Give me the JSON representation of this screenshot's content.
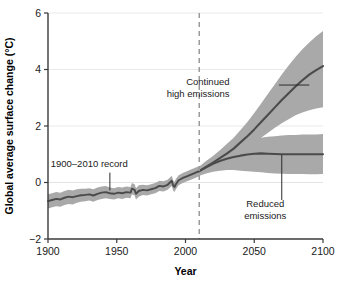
{
  "chart_data": {
    "type": "line",
    "title": "",
    "xlabel": "Year",
    "ylabel": "Global average surface change (°C)",
    "xlim": [
      1900,
      2100
    ],
    "ylim": [
      -2,
      6
    ],
    "xticks": [
      1900,
      1950,
      2000,
      2050,
      2100
    ],
    "yticks": [
      -2,
      0,
      2,
      4,
      6
    ],
    "xtick_labels": [
      "1900",
      "1950",
      "2000",
      "2050",
      "2100"
    ],
    "ytick_labels": [
      "−2",
      "0",
      "2",
      "4",
      "6"
    ],
    "grid": "horizontal",
    "legend": "none",
    "colors": {
      "line": "#4b4b4b",
      "band": "#a9a9a9",
      "grid": "#e9e9e9",
      "axis": "#3a3a3a",
      "divider": "#9a9a9a",
      "background": "#ffffff"
    },
    "divider": {
      "x": 2010,
      "style": "dashed",
      "label": ""
    },
    "annotations": [
      {
        "name": "historical-record",
        "text": "1900–2010 record",
        "text_x": 1930,
        "text_y": 0.55,
        "leader_from_x": 1945,
        "leader_from_y": 0.35,
        "leader_to_x": 1945,
        "leader_to_y": -0.28
      },
      {
        "name": "continued-high-emissions",
        "line1": "Continued",
        "line2": "high emissions",
        "text_x": 2032,
        "text_y": 3.45,
        "leader_from_x": 2068,
        "leader_from_y": 3.45,
        "leader_to_x": 2090,
        "leader_to_y": 3.45
      },
      {
        "name": "reduced-emissions",
        "line1": "Reduced",
        "line2": "emissions",
        "text_x": 2058,
        "text_y": -0.85,
        "leader_from_x": 2070,
        "leader_from_y": -0.62,
        "leader_to_x": 2070,
        "leader_to_y": 0.98
      }
    ],
    "series": [
      {
        "name": "historical",
        "label": "1900–2010 record",
        "x": [
          1900,
          1903,
          1906,
          1909,
          1912,
          1915,
          1918,
          1921,
          1924,
          1927,
          1930,
          1933,
          1936,
          1939,
          1942,
          1945,
          1948,
          1951,
          1954,
          1957,
          1960,
          1961,
          1963,
          1964,
          1966,
          1969,
          1972,
          1975,
          1978,
          1981,
          1984,
          1987,
          1990,
          1991,
          1992,
          1993,
          1995,
          1998,
          2001,
          2004,
          2007,
          2010
        ],
        "y": [
          -0.66,
          -0.62,
          -0.58,
          -0.6,
          -0.54,
          -0.5,
          -0.52,
          -0.48,
          -0.45,
          -0.44,
          -0.42,
          -0.46,
          -0.4,
          -0.36,
          -0.34,
          -0.38,
          -0.4,
          -0.36,
          -0.38,
          -0.34,
          -0.36,
          -0.22,
          -0.26,
          -0.4,
          -0.3,
          -0.26,
          -0.28,
          -0.24,
          -0.2,
          -0.12,
          -0.14,
          -0.08,
          0.06,
          -0.1,
          -0.16,
          -0.06,
          0.08,
          0.16,
          0.22,
          0.28,
          0.34,
          0.4
        ],
        "lower": [
          -0.92,
          -0.88,
          -0.84,
          -0.86,
          -0.8,
          -0.76,
          -0.78,
          -0.72,
          -0.68,
          -0.66,
          -0.64,
          -0.68,
          -0.62,
          -0.58,
          -0.56,
          -0.58,
          -0.6,
          -0.56,
          -0.58,
          -0.54,
          -0.56,
          -0.42,
          -0.46,
          -0.6,
          -0.5,
          -0.44,
          -0.46,
          -0.42,
          -0.38,
          -0.3,
          -0.32,
          -0.26,
          -0.12,
          -0.28,
          -0.34,
          -0.24,
          -0.1,
          -0.02,
          0.04,
          0.1,
          0.16,
          0.22
        ],
        "upper": [
          -0.42,
          -0.38,
          -0.34,
          -0.36,
          -0.3,
          -0.26,
          -0.28,
          -0.24,
          -0.22,
          -0.22,
          -0.2,
          -0.24,
          -0.18,
          -0.14,
          -0.12,
          -0.18,
          -0.2,
          -0.16,
          -0.18,
          -0.14,
          -0.16,
          -0.02,
          -0.06,
          -0.2,
          -0.1,
          -0.08,
          -0.1,
          -0.06,
          -0.02,
          0.06,
          0.04,
          0.1,
          0.24,
          0.08,
          0.02,
          0.12,
          0.26,
          0.34,
          0.4,
          0.46,
          0.52,
          0.58
        ]
      },
      {
        "name": "continued_high_emissions",
        "label": "Continued high emissions",
        "x": [
          2010,
          2015,
          2020,
          2025,
          2030,
          2035,
          2040,
          2045,
          2050,
          2055,
          2060,
          2065,
          2070,
          2075,
          2080,
          2085,
          2090,
          2095,
          2100
        ],
        "y": [
          0.4,
          0.55,
          0.7,
          0.86,
          1.02,
          1.2,
          1.42,
          1.64,
          1.88,
          2.14,
          2.4,
          2.66,
          2.92,
          3.16,
          3.4,
          3.62,
          3.82,
          3.98,
          4.12
        ],
        "lower": [
          0.24,
          0.36,
          0.5,
          0.62,
          0.76,
          0.9,
          1.06,
          1.22,
          1.4,
          1.58,
          1.76,
          1.94,
          2.1,
          2.24,
          2.38,
          2.48,
          2.56,
          2.62,
          2.66
        ],
        "upper": [
          0.56,
          0.76,
          0.94,
          1.14,
          1.36,
          1.58,
          1.86,
          2.14,
          2.46,
          2.8,
          3.14,
          3.48,
          3.82,
          4.14,
          4.44,
          4.72,
          4.96,
          5.18,
          5.36
        ]
      },
      {
        "name": "reduced_emissions",
        "label": "Reduced emissions",
        "x": [
          2010,
          2015,
          2020,
          2025,
          2030,
          2035,
          2040,
          2045,
          2050,
          2055,
          2060,
          2065,
          2070,
          2075,
          2080,
          2085,
          2090,
          2095,
          2100
        ],
        "y": [
          0.4,
          0.54,
          0.66,
          0.76,
          0.84,
          0.9,
          0.95,
          0.99,
          1.02,
          1.03,
          1.02,
          1.01,
          1.0,
          1.0,
          1.0,
          1.0,
          1.0,
          1.0,
          1.0
        ],
        "lower": [
          0.24,
          0.32,
          0.38,
          0.42,
          0.44,
          0.44,
          0.42,
          0.4,
          0.38,
          0.36,
          0.34,
          0.32,
          0.31,
          0.3,
          0.3,
          0.3,
          0.29,
          0.29,
          0.3
        ],
        "upper": [
          0.56,
          0.74,
          0.9,
          1.04,
          1.16,
          1.26,
          1.36,
          1.44,
          1.52,
          1.58,
          1.62,
          1.64,
          1.66,
          1.68,
          1.68,
          1.7,
          1.7,
          1.7,
          1.72
        ]
      }
    ]
  }
}
